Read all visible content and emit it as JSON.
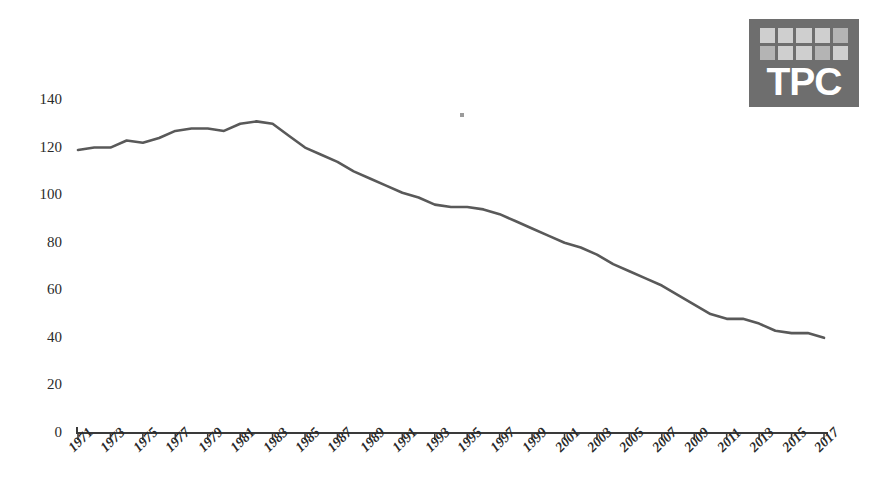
{
  "logo": {
    "text": "TPC",
    "background_color": "#6e6e6e",
    "tile_color": "#cfcfcf",
    "text_color": "#ffffff",
    "tile_rows": 2,
    "tile_columns": 5,
    "name": "tpc-logo"
  },
  "chart_data": {
    "type": "line",
    "title": "",
    "subtitle": "",
    "xlabel": "",
    "ylabel": "",
    "xlim": [
      1971,
      2017
    ],
    "ylim": [
      0,
      140
    ],
    "grid": false,
    "legend": null,
    "line_color": "#595959",
    "axis_color": "#3a3a3a",
    "y_ticks": [
      0,
      20,
      40,
      60,
      80,
      100,
      120,
      140
    ],
    "y_tick_labels": [
      "0",
      "20",
      "40",
      "60",
      "80",
      "100",
      "120",
      "140"
    ],
    "x_ticks": [
      1971,
      1973,
      1975,
      1977,
      1979,
      1981,
      1983,
      1985,
      1987,
      1989,
      1991,
      1993,
      1995,
      1997,
      1999,
      2001,
      2003,
      2005,
      2007,
      2009,
      2011,
      2013,
      2015,
      2017
    ],
    "x_tick_labels": [
      "1971",
      "1973",
      "1975",
      "1977",
      "1979",
      "1981",
      "1983",
      "1985",
      "1987",
      "1989",
      "1991",
      "1993",
      "1995",
      "1997",
      "1999",
      "2001",
      "2003",
      "2005",
      "2007",
      "2009",
      "2011",
      "2013",
      "2015",
      "2017"
    ],
    "x": [
      1971,
      1972,
      1973,
      1974,
      1975,
      1976,
      1977,
      1978,
      1979,
      1980,
      1981,
      1982,
      1983,
      1984,
      1985,
      1986,
      1987,
      1988,
      1989,
      1990,
      1991,
      1992,
      1993,
      1994,
      1995,
      1996,
      1997,
      1998,
      1999,
      2000,
      2001,
      2002,
      2003,
      2004,
      2005,
      2006,
      2007,
      2008,
      2009,
      2010,
      2011,
      2012,
      2013,
      2014,
      2015,
      2016,
      2017
    ],
    "values": [
      119,
      120,
      120,
      123,
      122,
      124,
      127,
      128,
      128,
      127,
      130,
      131,
      130,
      125,
      120,
      117,
      114,
      110,
      107,
      104,
      101,
      99,
      96,
      95,
      95,
      94,
      92,
      89,
      86,
      83,
      80,
      78,
      75,
      71,
      68,
      65,
      62,
      58,
      54,
      50,
      48,
      48,
      46,
      43,
      42,
      42,
      40
    ],
    "series": [
      {
        "name": "series-1",
        "values": [
          119,
          120,
          120,
          123,
          122,
          124,
          127,
          128,
          128,
          127,
          130,
          131,
          130,
          125,
          120,
          117,
          114,
          110,
          107,
          104,
          101,
          99,
          96,
          95,
          95,
          94,
          92,
          89,
          86,
          83,
          80,
          78,
          75,
          71,
          68,
          65,
          62,
          58,
          54,
          50,
          48,
          48,
          46,
          43,
          42,
          42,
          40
        ]
      }
    ],
    "annotations": []
  },
  "artifact": {
    "name": "scan-speck"
  }
}
